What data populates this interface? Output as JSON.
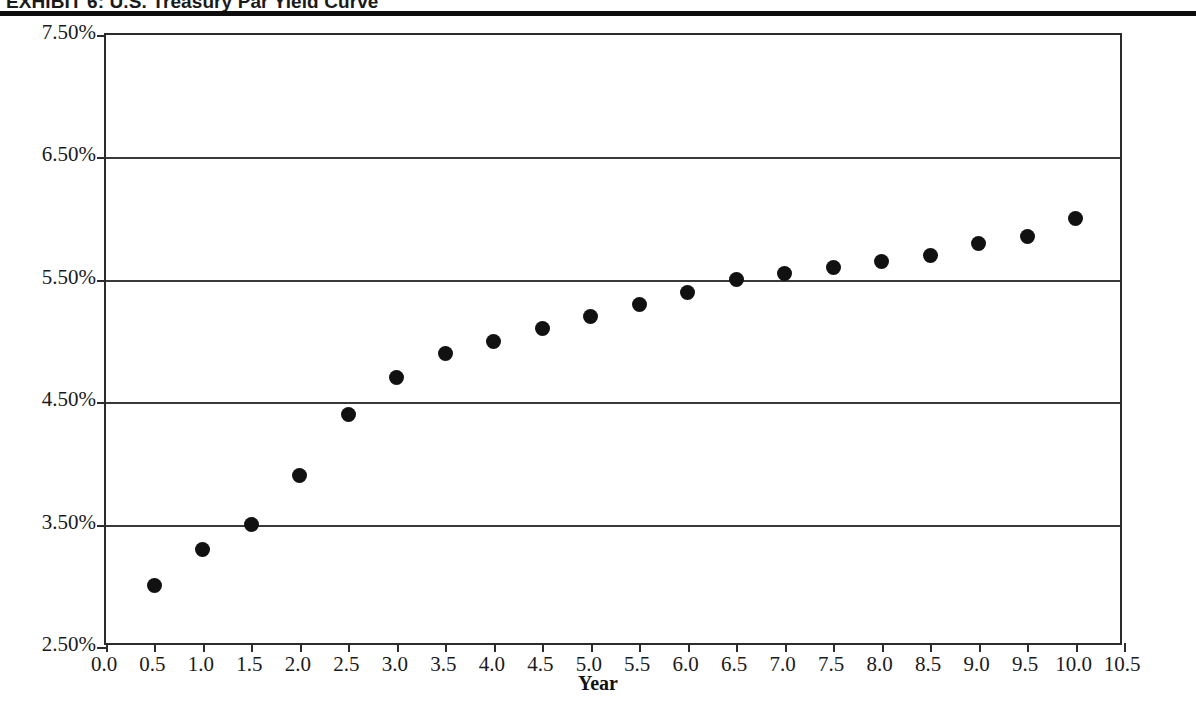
{
  "exhibit": {
    "title": "EXHIBIT 6: U.S. Treasury Par Yield Curve"
  },
  "chart_data": {
    "type": "scatter",
    "title": "EXHIBIT 6: U.S. Treasury Par Yield Curve",
    "xlabel": "Year",
    "ylabel": "",
    "xlim": [
      0.0,
      10.5
    ],
    "ylim": [
      2.5,
      7.5
    ],
    "xticks": [
      "0.0",
      "0.5",
      "1.0",
      "1.5",
      "2.0",
      "2.5",
      "3.0",
      "3.5",
      "4.0",
      "4.5",
      "5.0",
      "5.5",
      "6.0",
      "6.5",
      "7.0",
      "7.5",
      "8.0",
      "8.5",
      "9.0",
      "9.5",
      "10.0",
      "10.5"
    ],
    "xtick_values": [
      0.0,
      0.5,
      1.0,
      1.5,
      2.0,
      2.5,
      3.0,
      3.5,
      4.0,
      4.5,
      5.0,
      5.5,
      6.0,
      6.5,
      7.0,
      7.5,
      8.0,
      8.5,
      9.0,
      9.5,
      10.0,
      10.5
    ],
    "yticks": [
      "2.50%",
      "3.50%",
      "4.50%",
      "5.50%",
      "6.50%",
      "7.50%"
    ],
    "ytick_values": [
      2.5,
      3.5,
      4.5,
      5.5,
      6.5,
      7.5
    ],
    "gridlines": {
      "horizontal": [
        3.5,
        4.5,
        5.5,
        6.5
      ],
      "vertical": []
    },
    "legend": null,
    "marker": {
      "shape": "circle",
      "color": "#111111",
      "size": 15
    },
    "x": [
      0.5,
      1.0,
      1.5,
      2.0,
      2.5,
      3.0,
      3.5,
      4.0,
      4.5,
      5.0,
      5.5,
      6.0,
      6.5,
      7.0,
      7.5,
      8.0,
      8.5,
      9.0,
      9.5,
      10.0
    ],
    "values": [
      3.0,
      3.3,
      3.5,
      3.9,
      4.4,
      4.7,
      4.9,
      5.0,
      5.1,
      5.2,
      5.3,
      5.4,
      5.5,
      5.55,
      5.6,
      5.65,
      5.7,
      5.8,
      5.85,
      6.0
    ],
    "units": "percent"
  }
}
